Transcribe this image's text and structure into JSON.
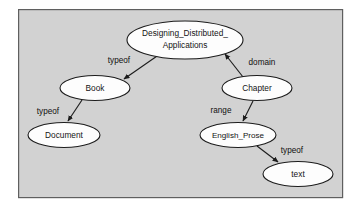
{
  "figure": {
    "canvas": {
      "background_color": "#d2d2d2",
      "border_color": "#5f5f5f",
      "page_color": "#ffffff"
    }
  },
  "diagram": {
    "type": "directed-graph",
    "node_shape": "ellipse",
    "node_fill": "#fdfdfd",
    "node_stroke": "#1c1c1c",
    "edge_color": "#1c1c1c",
    "nodes": [
      {
        "id": "root",
        "label": "Designing_Distributed_Applications",
        "line1": "Designing_Distributed_",
        "line2": "Applications",
        "cx": 185,
        "cy": 40,
        "rx": 58,
        "ry": 19
      },
      {
        "id": "book",
        "label": "Book",
        "line1": "Book",
        "line2": "",
        "cx": 95,
        "cy": 88,
        "rx": 35,
        "ry": 12.5
      },
      {
        "id": "document",
        "label": "Document",
        "line1": "Document",
        "line2": "",
        "cx": 64,
        "cy": 135,
        "rx": 36,
        "ry": 12.5
      },
      {
        "id": "chapter",
        "label": "Chapter",
        "line1": "Chapter",
        "line2": "",
        "cx": 257,
        "cy": 88,
        "rx": 35,
        "ry": 12.5
      },
      {
        "id": "english_prose",
        "label": "English_Prose",
        "line1": "English_Prose",
        "line2": "",
        "cx": 238,
        "cy": 135,
        "rx": 38,
        "ry": 12.5
      },
      {
        "id": "text",
        "label": "text",
        "line1": "text",
        "line2": "",
        "cx": 298,
        "cy": 174,
        "rx": 35,
        "ry": 12.5
      }
    ],
    "edges": [
      {
        "id": "edge-root-book",
        "label": "typeof",
        "from": "root",
        "to": "book",
        "x1": 160,
        "y1": 54,
        "x2": 124,
        "y2": 79,
        "label_x": 119,
        "label_y": 61
      },
      {
        "id": "edge-book-document",
        "label": "typeof",
        "from": "book",
        "to": "document",
        "x1": 82,
        "y1": 100,
        "x2": 68,
        "y2": 121,
        "label_x": 48,
        "label_y": 112
      },
      {
        "id": "edge-chapter-root",
        "label": "domain",
        "from": "chapter",
        "to": "root",
        "x1": 243,
        "y1": 77,
        "x2": 225,
        "y2": 54,
        "label_x": 262,
        "label_y": 63
      },
      {
        "id": "edge-chapter-english-prose",
        "label": "range",
        "from": "chapter",
        "to": "english_prose",
        "x1": 253,
        "y1": 101,
        "x2": 243,
        "y2": 121,
        "label_x": 221,
        "label_y": 111
      },
      {
        "id": "edge-english-prose-text",
        "label": "typeof",
        "from": "english_prose",
        "to": "text",
        "x1": 257,
        "y1": 146,
        "x2": 278,
        "y2": 162,
        "label_x": 292,
        "label_y": 151
      }
    ]
  }
}
